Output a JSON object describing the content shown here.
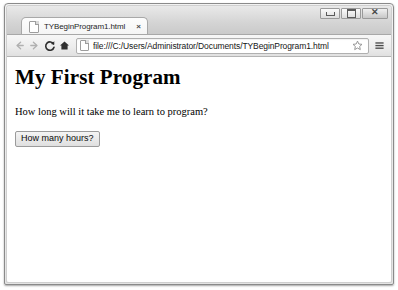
{
  "window": {
    "controls": {
      "minimize_label": "Minimize",
      "maximize_label": "Maximize",
      "close_label": "Close"
    }
  },
  "browser": {
    "tab": {
      "title": "TYBeginProgram1.html",
      "close_label": "×",
      "favicon": "page-icon"
    },
    "toolbar": {
      "back_label": "Back",
      "forward_label": "Forward",
      "reload_label": "Reload",
      "home_label": "Home",
      "bookmark_label": "Bookmark this page",
      "menu_label": "Customize and control",
      "url": "file:///C:/Users/Administrator/Documents/TYBeginProgram1.html",
      "url_placeholder": "Search Google or type URL"
    }
  },
  "page": {
    "heading": "My First Program",
    "paragraph": "How long will it take me to learn to program?",
    "button_label": "How many hours?"
  },
  "colors": {
    "chrome_top": "#e9e9e9",
    "chrome_bottom": "#c9c9c9",
    "toolbar": "#ececec",
    "border": "#8a8a8a",
    "page_background": "#ffffff",
    "text": "#000000"
  }
}
